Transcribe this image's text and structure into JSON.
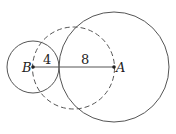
{
  "diagram": {
    "points": {
      "B": {
        "label": "B",
        "x": 33,
        "y": 67
      },
      "A": {
        "label": "A",
        "x": 114,
        "y": 67
      }
    },
    "segment_labels": {
      "BC": "4",
      "CA": "8"
    },
    "circles": [
      {
        "name": "small-circle",
        "center": "B",
        "cx": 33,
        "cy": 67,
        "r": 26,
        "style": "solid"
      },
      {
        "name": "large-circle",
        "center": "A",
        "cx": 114,
        "cy": 67,
        "r": 55,
        "style": "solid"
      },
      {
        "name": "dashed-circle",
        "cx": 73,
        "cy": 68,
        "r": 41,
        "style": "dashed"
      }
    ],
    "colors": {
      "stroke": "#555555",
      "text": "#222222"
    }
  }
}
